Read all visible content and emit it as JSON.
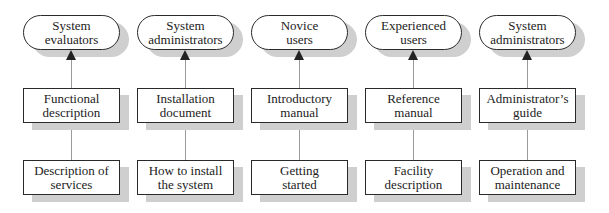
{
  "diagram": {
    "columns": [
      {
        "audience": "System evaluators",
        "audience_lines": [
          "System",
          "evaluators"
        ],
        "doc": "Functional description",
        "doc_lines": [
          "Functional",
          "description"
        ],
        "content": "Description of services",
        "content_lines": [
          "Description of",
          "services"
        ]
      },
      {
        "audience": "System administrators",
        "audience_lines": [
          "System",
          "administrators"
        ],
        "doc": "Installation document",
        "doc_lines": [
          "Installation",
          "document"
        ],
        "content": "How to install the system",
        "content_lines": [
          "How to install",
          "the system"
        ]
      },
      {
        "audience": "Novice users",
        "audience_lines": [
          "Novice",
          "users"
        ],
        "doc": "Introductory manual",
        "doc_lines": [
          "Introductory",
          "manual"
        ],
        "content": "Getting started",
        "content_lines": [
          "Getting",
          "started"
        ]
      },
      {
        "audience": "Experienced users",
        "audience_lines": [
          "Experienced",
          "users"
        ],
        "doc": "Reference manual",
        "doc_lines": [
          "Reference",
          "manual"
        ],
        "content": "Facility description",
        "content_lines": [
          "Facility",
          "description"
        ]
      },
      {
        "audience": "System administrators",
        "audience_lines": [
          "System",
          "administrators"
        ],
        "doc": "Administrator's guide",
        "doc_lines": [
          "Administrator’s",
          "guide"
        ],
        "content": "Operation and maintenance",
        "content_lines": [
          "Operation and",
          "maintenance"
        ]
      }
    ]
  }
}
